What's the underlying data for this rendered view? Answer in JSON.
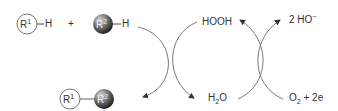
{
  "reaction": {
    "reactant1": {
      "group": "R",
      "index": "1",
      "bond": "H"
    },
    "plus": "+",
    "reactant2": {
      "group": "R",
      "index": "2",
      "bond": "H"
    },
    "product": {
      "group1": "R",
      "index1": "1",
      "group2": "R",
      "index2": "2"
    }
  },
  "cycle": {
    "hooh": "HOOH",
    "h2o": {
      "main": "H",
      "sub": "2",
      "tail": "O"
    },
    "hydroxide": {
      "main": "2 HO",
      "sup": "−"
    },
    "oxygen": {
      "main": "O",
      "sub": "2",
      "tail": " + 2e"
    }
  },
  "colors": {
    "line": "#666666",
    "sphere_dark": "#333333",
    "sphere_light": "#bbbbbb"
  }
}
